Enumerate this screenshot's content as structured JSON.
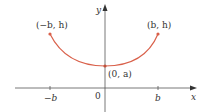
{
  "diagram": {
    "type": "catenary-curve",
    "curve_color": "#d9604a",
    "axis_color": "#555555",
    "axes": {
      "x_label": "x",
      "y_label": "y",
      "origin_label": "0"
    },
    "ticks": [
      {
        "label": "−b",
        "x": 50
      },
      {
        "label": "b",
        "x": 158
      }
    ],
    "points": [
      {
        "label": "(−b, h)",
        "name": "left-endpoint"
      },
      {
        "label": "(b, h)",
        "name": "right-endpoint"
      },
      {
        "label": "(0, a)",
        "name": "vertex"
      }
    ]
  }
}
